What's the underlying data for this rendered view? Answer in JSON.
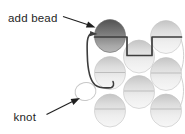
{
  "labels": {
    "add_bead": "add bead",
    "knot": "knot"
  },
  "colors": {
    "background": "#ffffff",
    "text": "#1f1f1f",
    "thread": "#3d3d3d",
    "faint_thread": "#bdbdbd",
    "faint_connector": "#d0d0d0",
    "knot_loop": "#c8c8c8",
    "new_bead_shade": "#6e6e6e",
    "light_bead_shade": "#e9e9e9"
  }
}
